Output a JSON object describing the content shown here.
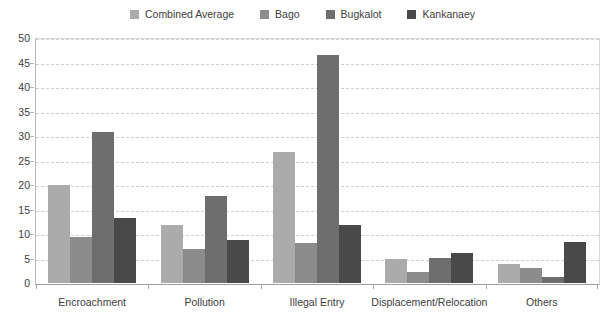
{
  "legend": {
    "position": "top-center",
    "items": [
      {
        "label": "Combined Average",
        "color": "#ababab",
        "swatch_name": "legend-swatch-combined-average"
      },
      {
        "label": "Bago",
        "color": "#8c8c8c",
        "swatch_name": "legend-swatch-bago"
      },
      {
        "label": "Bugkalot",
        "color": "#6e6e6e",
        "swatch_name": "legend-swatch-bugkalot"
      },
      {
        "label": "Kankanaey",
        "color": "#494949",
        "swatch_name": "legend-swatch-kankanaey"
      }
    ]
  },
  "axes": {
    "y_tick_labels": [
      "50",
      "45",
      "40",
      "35",
      "30",
      "25",
      "20",
      "15",
      "10",
      "5",
      "0"
    ],
    "x_tick_labels": [
      "Encroachment",
      "Pollution",
      "Illegal Entry",
      "Displacement/Relocation",
      "Others"
    ]
  },
  "chart_data": {
    "type": "bar",
    "title": "",
    "subtitle": "",
    "xlabel": "",
    "ylabel": "",
    "ylim": [
      0,
      50
    ],
    "ytick_step": 5,
    "grid": true,
    "legend_position": "top-center",
    "categories": [
      "Encroachment",
      "Pollution",
      "Illegal Entry",
      "Displacement/Relocation",
      "Others"
    ],
    "series": [
      {
        "name": "Combined Average",
        "color": "#ababab",
        "values": [
          20.0,
          11.8,
          26.8,
          4.8,
          3.8
        ]
      },
      {
        "name": "Bago",
        "color": "#8c8c8c",
        "values": [
          9.3,
          7.0,
          8.2,
          2.2,
          3.0
        ]
      },
      {
        "name": "Bugkalot",
        "color": "#6e6e6e",
        "values": [
          30.8,
          17.7,
          46.5,
          5.1,
          1.3
        ]
      },
      {
        "name": "Kankanaey",
        "color": "#494949",
        "values": [
          13.2,
          8.8,
          11.8,
          6.1,
          8.4
        ]
      }
    ]
  }
}
